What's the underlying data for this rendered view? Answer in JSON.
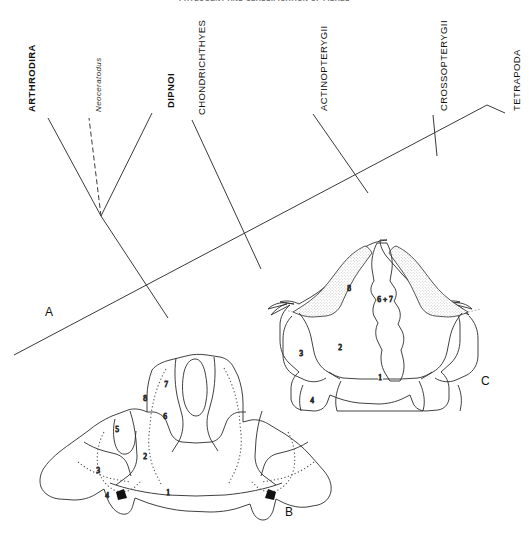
{
  "figure": {
    "header_partial": "PHYLOGENY AND CLASSIFICATION OF FISHES",
    "panels": [
      {
        "id": "A",
        "label": "A",
        "caption": "cladogram"
      },
      {
        "id": "B",
        "label": "B",
        "caption": "skull roof diagram"
      },
      {
        "id": "C",
        "label": "C",
        "caption": "skull roof diagram"
      }
    ]
  },
  "cladogram": {
    "taxa": [
      {
        "name": "ARTHRODIRA",
        "style": "bold"
      },
      {
        "name": "Neoceratodus",
        "style": "italic"
      },
      {
        "name": "DIPNOI",
        "style": "bold"
      },
      {
        "name": "CHONDRICHTHYES",
        "style": "regular"
      },
      {
        "name": "ACTINOPTERYGII",
        "style": "regular"
      },
      {
        "name": "CROSSOPTERYGII",
        "style": "regular"
      },
      {
        "name": "TETRAPODA",
        "style": "regular"
      }
    ]
  },
  "skull_b": {
    "label": "B",
    "region_numbers": [
      "1",
      "2",
      "3",
      "4",
      "5",
      "6",
      "7",
      "8"
    ]
  },
  "skull_c": {
    "label": "C",
    "region_numbers": [
      "1",
      "2",
      "3",
      "4",
      "6 + 7",
      "8"
    ]
  },
  "colors": {
    "ink": "#222222",
    "stipple": "#e8e6e2",
    "background": "#ffffff"
  }
}
